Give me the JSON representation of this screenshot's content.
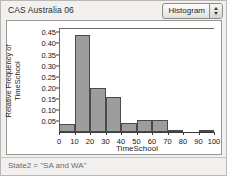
{
  "window": {
    "title": "CAS Australia 06"
  },
  "toolbar": {
    "plot_type_label": "Histogram",
    "plot_type_icon": "stepper-up-down-icon"
  },
  "status": {
    "text": "State2 = \"SA and WA\""
  },
  "colors": {
    "bar_fill": "#9d9d9d",
    "bar_stroke": "#4a4a4a",
    "plot_background": "#ffffff",
    "window_background": "#f2f1ef",
    "axis": "#3a3a3a",
    "status_text": "#6d6b68"
  },
  "chart_data": {
    "type": "bar",
    "title": "",
    "xlabel": "TimeSchool",
    "ylabel": "Relative Frequency of TimeSchool",
    "ylabel_lines": [
      "Relative Frequency of",
      "TimeSchool"
    ],
    "xlim": [
      0,
      100
    ],
    "ylim": [
      0,
      0.47
    ],
    "grid": false,
    "legend": null,
    "bin_width": 10,
    "bin_edges": [
      0,
      10,
      20,
      30,
      40,
      50,
      60,
      70,
      80,
      90,
      100
    ],
    "categories": [
      "0-10",
      "10-20",
      "20-30",
      "30-40",
      "40-50",
      "50-60",
      "60-70",
      "70-80",
      "80-90",
      "90-100"
    ],
    "values": [
      0.035,
      0.44,
      0.198,
      0.156,
      0.043,
      0.056,
      0.056,
      0.01,
      0.0,
      0.01
    ],
    "ytick_values": [
      0.05,
      0.1,
      0.15,
      0.2,
      0.25,
      0.3,
      0.35,
      0.4,
      0.45
    ],
    "ytick_labels": [
      "0.05",
      "0.10",
      "0.15",
      "0.20",
      "0.25",
      "0.30",
      "0.35",
      "0.40",
      "0.45"
    ],
    "xtick_values": [
      0,
      10,
      20,
      30,
      40,
      50,
      60,
      70,
      80,
      90,
      100
    ],
    "xtick_labels": [
      "0",
      "10",
      "20",
      "30",
      "40",
      "50",
      "60",
      "70",
      "80",
      "90",
      "100"
    ]
  }
}
